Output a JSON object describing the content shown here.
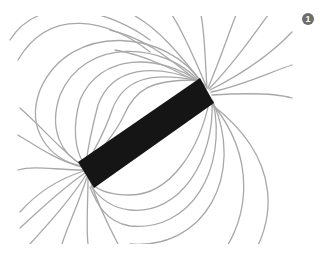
{
  "figure": {
    "badge_label": "1",
    "colors": {
      "background": "#ffffff",
      "field_line": "#a8a8a8",
      "magnet": "#151515",
      "badge": "#6e6e6e"
    },
    "clip": {
      "x": 0,
      "y": 16,
      "width": 333,
      "height": 228
    },
    "magnet": {
      "points": [
        [
          200,
          78
        ],
        [
          214,
          103
        ],
        [
          94,
          188
        ],
        [
          78,
          162
        ]
      ],
      "north_pole": [
        207,
        90
      ],
      "south_pole": [
        86,
        175
      ]
    },
    "field_lines": {
      "closed_loops_upper": [
        "M 202 84 C 170 30, 70 20, 40 90 C 25 130, 50 160, 82 166",
        "M 200 82 C 165 42, 85 36, 60 95 C 48 130, 62 155, 83 165",
        "M 198 81 C 160 54, 100 52, 80 100 C 72 128, 75 150, 84 164",
        "M 196 80 C 155 64, 112 66, 98 105 C 92 128, 88 148, 86 163",
        "M 195 80 C 152 72, 124 78, 112 110 C 106 130, 96 146, 88 162",
        "M 194 80 C 150 80, 135 90, 124 115 C 116 132, 104 146, 90 162",
        "M 150 52 C 110 20, 50 5, 18 60",
        "M 150 40 C 110 10, 40 -8, 10 40"
      ],
      "closed_loops_lower": [
        "M 210 98 C 200 150, 170 195, 130 195 C 110 195, 98 190, 92 184",
        "M 212 100 C 215 160, 180 215, 130 210 C 110 208, 98 196, 91 186",
        "M 213 101 C 228 170, 190 232, 130 226 C 105 222, 96 202, 90 187",
        "M 213 102 C 245 175, 205 250, 130 244",
        "M 212 103 C 262 165, 245 230, 215 262",
        "M 211 104 C 285 160, 275 225, 248 262"
      ],
      "north_spokes": [
        "M 207 88 C 195 60, 185 35, 172 15",
        "M 207 88 C 205 60, 205 35, 201 15",
        "M 208 88 C 220 60, 228 35, 236 15",
        "M 209 89 C 232 65, 250 40, 268 15",
        "M 210 90 C 240 75, 270 55, 292 32",
        "M 211 92 C 245 85, 275 70, 292 65",
        "M 212 95 C 245 93, 275 93, 292 98",
        "M 205 86 C 180 55, 160 30, 135 16",
        "M 204 86 C 170 60, 150 40, 110 30",
        "M 203 85 C 175 70, 145 55, 115 50"
      ],
      "south_spokes": [
        "M 84 170 C 55 170, 35 165, 18 170",
        "M 84 171 C 55 180, 35 195, 20 212",
        "M 85 173 C 60 190, 40 210, 20 228",
        "M 86 175 C 70 200, 50 222, 30 244",
        "M 87 177 C 78 205, 68 225, 62 244",
        "M 88 178 C 88 205, 86 225, 88 244",
        "M 90 180 C 98 205, 108 225, 118 244",
        "M 82 167 C 55 160, 35 145, 18 135",
        "M 83 166 C 60 150, 45 130, 20 108"
      ]
    }
  }
}
